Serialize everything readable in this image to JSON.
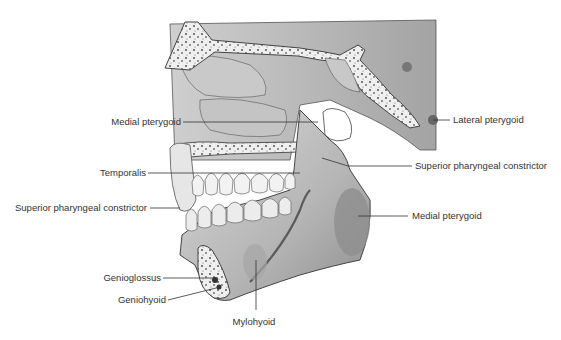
{
  "diagram": {
    "colors": {
      "bone": "#d6d6d6",
      "bone_dark": "#9a9a9a",
      "cancellous": "#eeeeee",
      "outline": "#4a4a4a",
      "leader_line": "#333333",
      "label_text": "#333333"
    },
    "labels": {
      "medial_pterygoid_upper": "Medial pterygoid",
      "temporalis": "Temporalis",
      "superior_pharyngeal_constrictor_left": "Superior pharyngeal constrictor",
      "genioglossus": "Genioglossus",
      "geniohyoid": "Geniohyoid",
      "mylohyoid": "Mylohyoid",
      "lateral_pterygoid": "Lateral pterygoid",
      "superior_pharyngeal_constrictor_right": "Superior pharyngeal constrictor",
      "medial_pterygoid_lower": "Medial pterygoid"
    }
  }
}
